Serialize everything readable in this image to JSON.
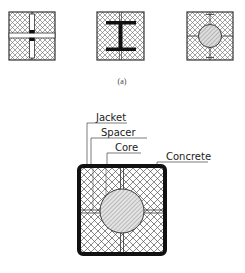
{
  "figure": {
    "caption": "(a)",
    "top_row": [
      {
        "name": "cross-shaped core section",
        "core": "cross"
      },
      {
        "name": "I-beam core section",
        "core": "i-beam"
      },
      {
        "name": "circular core section",
        "core": "circle"
      }
    ],
    "detail": {
      "labels": {
        "jacket": "Jacket",
        "spacer": "Spacer",
        "core": "Core",
        "concrete": "Concrete"
      }
    }
  },
  "colors": {
    "line": "#222222",
    "hatch": "#555555",
    "core_fill": "#dddddd",
    "background": "#ffffff"
  }
}
